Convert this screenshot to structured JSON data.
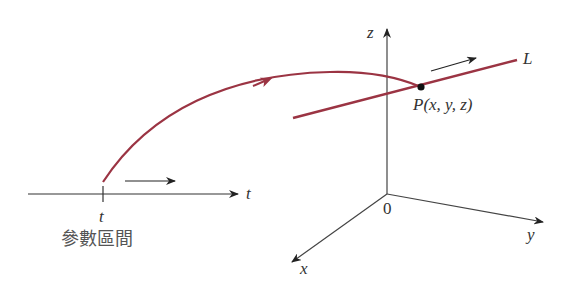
{
  "diagram": {
    "param_axis": {
      "label": "t",
      "tick_label": "t",
      "caption": "參數區間"
    },
    "space_axes": {
      "x_label": "x",
      "y_label": "y",
      "z_label": "z",
      "origin_label": "0"
    },
    "line": {
      "label": "L"
    },
    "point": {
      "label": "P(x, y, z)"
    },
    "colors": {
      "curve": "#9b3443",
      "axes": "#333333"
    }
  }
}
